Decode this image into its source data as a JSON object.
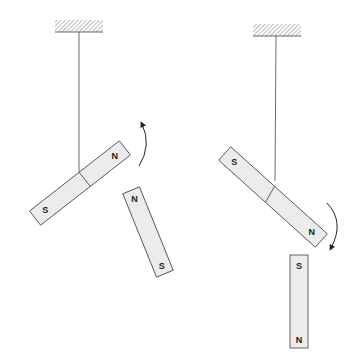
{
  "figure": {
    "colors": {
      "magnet_fill": "#ececec",
      "outline": "#555555",
      "string": "#444444",
      "background": "#ffffff"
    },
    "left_panel": {
      "suspended_magnet": {
        "north_label": "N",
        "south_label": "S"
      },
      "free_magnet": {
        "north_label": "N",
        "south_label": "S"
      },
      "rotation_arrow": "counterclockwise"
    },
    "right_panel": {
      "suspended_magnet": {
        "north_label": "N",
        "south_label": "S"
      },
      "free_magnet": {
        "north_label": "S",
        "south_label": "N"
      },
      "rotation_arrow": "clockwise"
    }
  }
}
